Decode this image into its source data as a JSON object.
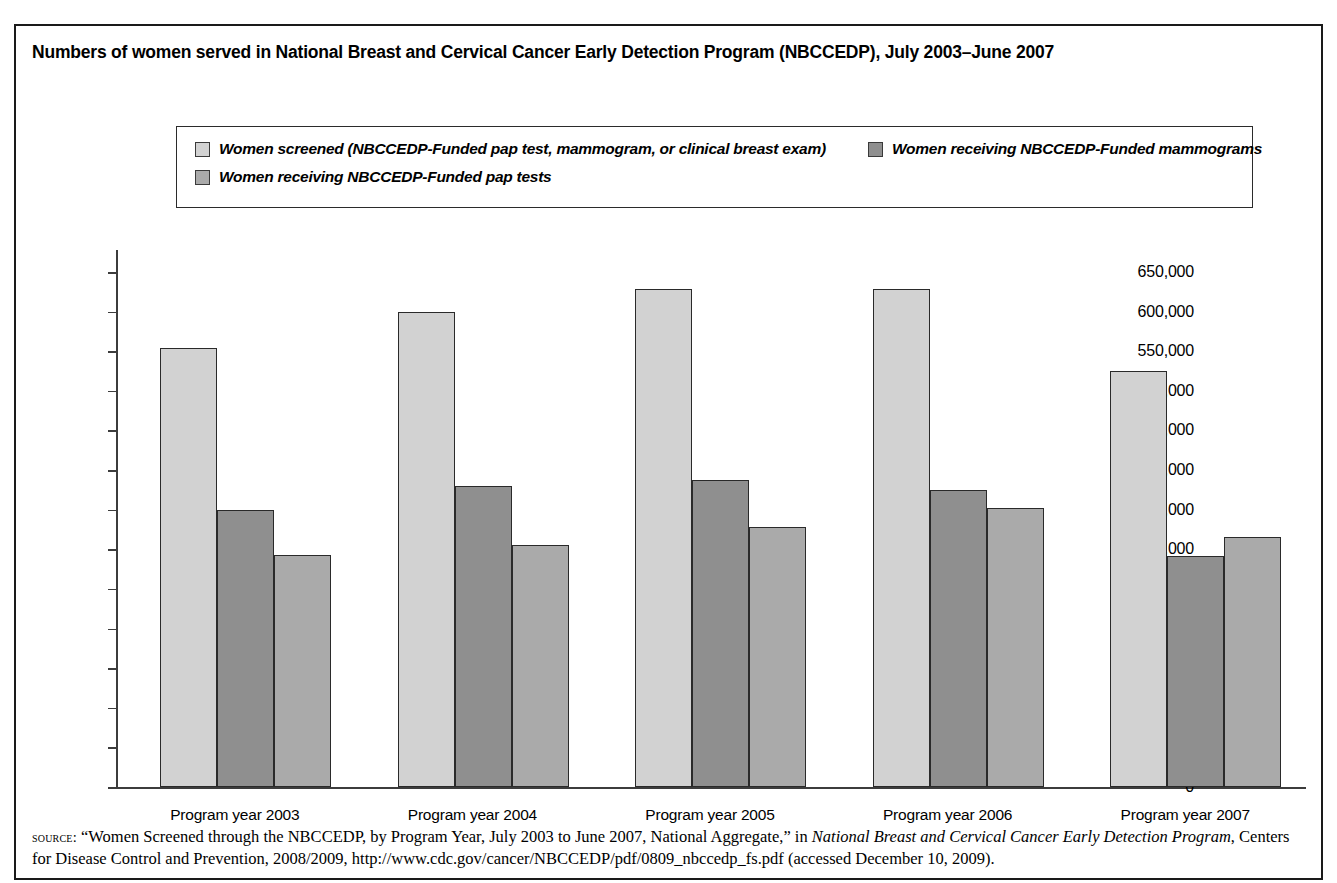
{
  "figure": {
    "title": "Numbers of women served in National Breast and Cervical Cancer Early Detection Program (NBCCEDP), July 2003–June 2007",
    "border_color": "#1a1a1a"
  },
  "legend": {
    "entries": [
      {
        "label": "Women screened (NBCCEDP-Funded pap test, mammogram, or clinical breast exam)",
        "color": "#d2d2d2",
        "key": "screened"
      },
      {
        "label": "Women receiving NBCCEDP-Funded mammograms",
        "color": "#8f8f8f",
        "key": "mammograms"
      },
      {
        "label": "Women receiving NBCCEDP-Funded pap tests",
        "color": "#aaaaaa",
        "key": "paptests"
      }
    ]
  },
  "source_note": {
    "label": "source:",
    "line1_pre": " “Women Screened through the NBCCEDP, by Program Year, July 2003 to June 2007, National Aggregate,” in ",
    "line1_italic": "National Breast and Cervical",
    "line2_italic": "Cancer Early Detection Program",
    "line2_post": ", Centers for Disease Control and Prevention, 2008/2009, http://www.cdc.gov/cancer/NBCCEDP/pdf/0809_nbccedp_fs",
    "line3": ".pdf (accessed December 10, 2009)."
  },
  "chart_data": {
    "type": "bar",
    "title": "Numbers of women served in National Breast and Cervical Cancer Early Detection Program (NBCCEDP), July 2003–June 2007",
    "xlabel": "",
    "ylabel": "",
    "categories": [
      "Program year 2003",
      "Program year 2004",
      "Program year 2005",
      "Program year 2006",
      "Program year 2007"
    ],
    "series": [
      {
        "name": "Women screened (NBCCEDP-Funded pap test, mammogram, or clinical breast exam)",
        "color": "#d2d2d2",
        "values": [
          554000,
          600000,
          628000,
          629000,
          525000
        ]
      },
      {
        "name": "Women receiving NBCCEDP-Funded mammograms",
        "color": "#8f8f8f",
        "values": [
          350000,
          380000,
          387000,
          375000,
          292000
        ]
      },
      {
        "name": "Women receiving NBCCEDP-Funded pap tests",
        "color": "#aaaaaa",
        "values": [
          293000,
          306000,
          328000,
          352000,
          315000
        ]
      }
    ],
    "ylim": [
      0,
      650000
    ],
    "ytick_step": 50000,
    "ytick_labels": [
      "650,000",
      "600,000",
      "550,000",
      "500,000",
      "450,000",
      "400,000",
      "350,000",
      "300,000",
      "250,000",
      "200,000",
      "150,000",
      "100,000",
      "50,000",
      "0"
    ],
    "grid": false,
    "legend_position": "top"
  }
}
